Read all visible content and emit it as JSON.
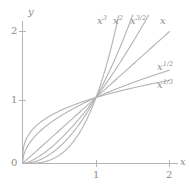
{
  "chart_data": {
    "type": "line",
    "title": "",
    "subtitle": "",
    "xlabel": "x",
    "ylabel": "y",
    "xlim": [
      0,
      2.2
    ],
    "ylim": [
      0,
      2.25
    ],
    "xticks": [
      "1",
      "2"
    ],
    "xtick_values": [
      1,
      2
    ],
    "yticks": [
      "1",
      "2"
    ],
    "ytick_values": [
      1,
      2
    ],
    "origin_label": "0",
    "grid": false,
    "legend_position": "inline-curve-end-labels",
    "line_color": "#b3b3b3",
    "axis_color": "#b0b0b0",
    "text_color": "#8c8c8c",
    "background_color": "#ffffff",
    "x": [
      0,
      0.1,
      0.2,
      0.3,
      0.4,
      0.5,
      0.6,
      0.7,
      0.8,
      0.9,
      1.0,
      1.1,
      1.2,
      1.3,
      1.4,
      1.5,
      1.6,
      1.7,
      1.8,
      1.9,
      2.0
    ],
    "series": [
      {
        "name": "x^3",
        "label": "x",
        "exponent": "3",
        "exponent_value": 3,
        "values": [
          0,
          0.001,
          0.008,
          0.027,
          0.064,
          0.125,
          0.216,
          0.343,
          0.512,
          0.729,
          1.0,
          1.331,
          1.728,
          2.197,
          2.744,
          3.375,
          4.096,
          4.913,
          5.832,
          6.859,
          8.0
        ]
      },
      {
        "name": "x^2",
        "label": "x",
        "exponent": "2",
        "exponent_value": 2,
        "values": [
          0,
          0.01,
          0.04,
          0.09,
          0.16,
          0.25,
          0.36,
          0.49,
          0.64,
          0.81,
          1.0,
          1.21,
          1.44,
          1.69,
          1.96,
          2.25,
          2.56,
          2.89,
          3.24,
          3.61,
          4.0
        ]
      },
      {
        "name": "x^3/2",
        "label": "x",
        "exponent": "3/2",
        "exponent_value": 1.5,
        "values": [
          0,
          0.0316,
          0.0894,
          0.1643,
          0.253,
          0.3536,
          0.4648,
          0.5857,
          0.7155,
          0.8538,
          1.0,
          1.1537,
          1.3145,
          1.4822,
          1.6565,
          1.8371,
          2.0239,
          2.2166,
          2.4152,
          2.6194,
          2.8284
        ]
      },
      {
        "name": "x",
        "label": "x",
        "exponent": "",
        "exponent_value": 1,
        "values": [
          0,
          0.1,
          0.2,
          0.3,
          0.4,
          0.5,
          0.6,
          0.7,
          0.8,
          0.9,
          1.0,
          1.1,
          1.2,
          1.3,
          1.4,
          1.5,
          1.6,
          1.7,
          1.8,
          1.9,
          2.0
        ]
      },
      {
        "name": "x^1/2",
        "label": "x",
        "exponent": "1/2",
        "exponent_value": 0.5,
        "values": [
          0,
          0.3162,
          0.4472,
          0.5477,
          0.6325,
          0.7071,
          0.7746,
          0.8367,
          0.8944,
          0.9487,
          1.0,
          1.0488,
          1.0954,
          1.1402,
          1.1832,
          1.2247,
          1.2649,
          1.3038,
          1.3416,
          1.3784,
          1.4142
        ]
      },
      {
        "name": "x^1/3",
        "label": "x",
        "exponent": "1/3",
        "exponent_value": 0.3333,
        "values": [
          0,
          0.4642,
          0.5848,
          0.6694,
          0.7368,
          0.7937,
          0.8434,
          0.8879,
          0.9283,
          0.9655,
          1.0,
          1.0323,
          1.0627,
          1.0914,
          1.1187,
          1.1447,
          1.1696,
          1.1935,
          1.2164,
          1.2386,
          1.2599
        ]
      }
    ],
    "annotations": [
      {
        "name": "label-x3",
        "base": "x",
        "exponent": "3",
        "x": 97,
        "y": 16
      },
      {
        "name": "label-x2",
        "base": "x",
        "exponent": "2",
        "x": 113,
        "y": 16
      },
      {
        "name": "label-x32",
        "base": "x",
        "exponent": "3/2",
        "x": 130,
        "y": 16
      },
      {
        "name": "label-x1",
        "base": "x",
        "exponent": "",
        "x": 160,
        "y": 16
      },
      {
        "name": "label-x12",
        "base": "x",
        "exponent": "1/2",
        "x": 157,
        "y": 62
      },
      {
        "name": "label-x13",
        "base": "x",
        "exponent": "1/3",
        "x": 157,
        "y": 80
      }
    ]
  },
  "axes": {
    "y_axis_name": "y",
    "x_axis_name": "x",
    "origin": "0",
    "x_tick_1": "1",
    "x_tick_2": "2",
    "y_tick_1": "1",
    "y_tick_2": "2"
  }
}
